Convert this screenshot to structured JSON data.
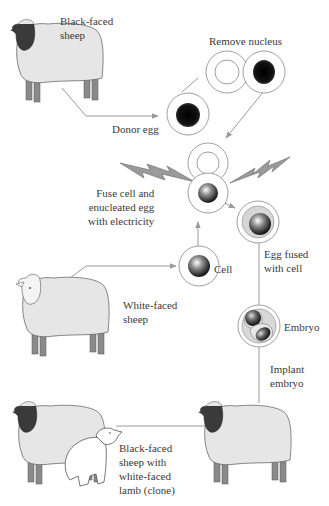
{
  "labels": {
    "black_faced_sheep": [
      "Black-faced",
      "sheep"
    ],
    "remove_nucleus": "Remove nucleus",
    "donor_egg": "Donor egg",
    "fuse": [
      "Fuse cell and",
      "enucleated egg",
      "with electricity"
    ],
    "egg_fused": [
      "Egg fused",
      "with cell"
    ],
    "cell": "Cell",
    "white_faced_sheep": [
      "White-faced",
      "sheep"
    ],
    "embryo": "Embryo",
    "implant": [
      "Implant",
      "embryo"
    ],
    "result": [
      "Black-faced",
      "sheep with",
      "white-faced",
      "lamb (clone)"
    ]
  },
  "colors": {
    "line": "#9a9a9a",
    "wool": "#e6e6e6",
    "outline": "#6a6a6a",
    "black_face": "#3a3a3a",
    "leg": "#8a8a8a",
    "nucleus": "#111111"
  }
}
